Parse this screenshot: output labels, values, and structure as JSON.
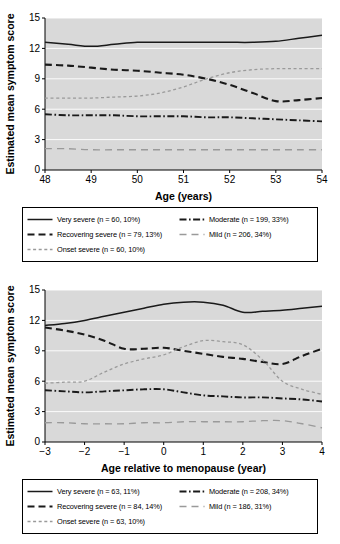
{
  "figure": {
    "panels": [
      {
        "id": "panel-age",
        "ylabel": "Estimated mean symptom score",
        "xlabel": "Age (years)",
        "legend": [
          {
            "label": "Very severe (n = 60, 10%)",
            "style": "solid",
            "color": "#1a1a1a"
          },
          {
            "label": "Recovering severe (n = 79, 13%)",
            "style": "dashed",
            "color": "#1a1a1a"
          },
          {
            "label": "Onset severe (n = 60, 10%)",
            "style": "dotted",
            "color": "#9a9a9a"
          },
          {
            "label": "Moderate (n = 199, 33%)",
            "style": "dashdot",
            "color": "#1a1a1a"
          },
          {
            "label": "Mild (n = 206, 34%)",
            "style": "longdash",
            "color": "#9a9a9a"
          }
        ]
      },
      {
        "id": "panel-menopause",
        "ylabel": "Estimated mean symptom score",
        "xlabel": "Age relative to menopause (year)",
        "legend": [
          {
            "label": "Very severe (n = 63, 11%)",
            "style": "solid",
            "color": "#1a1a1a"
          },
          {
            "label": "Recovering severe (n = 84, 14%)",
            "style": "dashed",
            "color": "#1a1a1a"
          },
          {
            "label": "Onset severe (n = 63, 10%)",
            "style": "dotted",
            "color": "#9a9a9a"
          },
          {
            "label": "Moderate (n = 208, 34%)",
            "style": "dashdot",
            "color": "#1a1a1a"
          },
          {
            "label": "Mild (n = 186, 31%)",
            "style": "longdash",
            "color": "#9a9a9a"
          }
        ]
      }
    ]
  },
  "chart_data": [
    {
      "type": "line",
      "title": "",
      "xlabel": "Age (years)",
      "ylabel": "Estimated mean symptom score",
      "xlim": [
        48,
        54
      ],
      "ylim": [
        0,
        15
      ],
      "xticks": [
        48,
        49,
        50,
        51,
        52,
        53,
        54
      ],
      "yticks": [
        0,
        3,
        6,
        9,
        12,
        15
      ],
      "grid": true,
      "grid_axis": "y",
      "plot_background": "#d9d9d9",
      "legend_position": "below",
      "x": [
        48,
        48.5,
        49,
        49.5,
        50,
        50.5,
        51,
        51.5,
        52,
        52.5,
        53,
        53.5,
        54
      ],
      "series": [
        {
          "name": "Very severe (n = 60, 10%)",
          "n": 60,
          "percent": 10,
          "style": "solid",
          "color": "#1a1a1a",
          "values": [
            12.6,
            12.4,
            12.2,
            12.4,
            12.6,
            12.6,
            12.6,
            12.6,
            12.6,
            12.6,
            12.7,
            13.0,
            13.3
          ]
        },
        {
          "name": "Recovering severe (n = 79, 13%)",
          "n": 79,
          "percent": 13,
          "style": "dashed",
          "color": "#1a1a1a",
          "values": [
            10.4,
            10.3,
            10.1,
            9.9,
            9.8,
            9.6,
            9.4,
            9.0,
            8.4,
            7.6,
            6.8,
            6.9,
            7.1
          ]
        },
        {
          "name": "Onset severe (n = 60, 10%)",
          "n": 60,
          "percent": 10,
          "style": "dotted",
          "color": "#9a9a9a",
          "values": [
            7.1,
            7.1,
            7.1,
            7.2,
            7.3,
            7.6,
            8.2,
            9.0,
            9.6,
            9.9,
            10.0,
            10.0,
            10.0
          ]
        },
        {
          "name": "Moderate (n = 199, 33%)",
          "n": 199,
          "percent": 33,
          "style": "dashdot",
          "color": "#1a1a1a",
          "values": [
            5.5,
            5.4,
            5.4,
            5.4,
            5.3,
            5.3,
            5.3,
            5.2,
            5.2,
            5.1,
            5.0,
            4.9,
            4.8
          ]
        },
        {
          "name": "Mild (n = 206, 34%)",
          "n": 206,
          "percent": 34,
          "style": "longdash",
          "color": "#9a9a9a",
          "values": [
            2.1,
            2.1,
            2.0,
            2.0,
            2.0,
            2.0,
            2.0,
            2.0,
            2.0,
            2.0,
            2.0,
            2.0,
            2.0
          ]
        }
      ]
    },
    {
      "type": "line",
      "title": "",
      "xlabel": "Age relative to menopause (year)",
      "ylabel": "Estimated mean symptom score",
      "xlim": [
        -3,
        4
      ],
      "ylim": [
        0,
        15
      ],
      "xticks": [
        -3,
        -2,
        -1,
        0,
        1,
        2,
        3,
        4
      ],
      "yticks": [
        0,
        3,
        6,
        9,
        12,
        15
      ],
      "grid": true,
      "grid_axis": "y",
      "plot_background": "#d9d9d9",
      "legend_position": "below",
      "x": [
        -3,
        -2.5,
        -2,
        -1.5,
        -1,
        -0.5,
        0,
        0.5,
        1,
        1.5,
        2,
        2.5,
        3,
        3.5,
        4
      ],
      "series": [
        {
          "name": "Very severe (n = 63, 11%)",
          "n": 63,
          "percent": 11,
          "style": "solid",
          "color": "#1a1a1a",
          "values": [
            11.5,
            11.7,
            12.0,
            12.4,
            12.8,
            13.2,
            13.6,
            13.8,
            13.8,
            13.5,
            12.8,
            12.9,
            13.0,
            13.2,
            13.4
          ]
        },
        {
          "name": "Recovering severe (n = 84, 14%)",
          "n": 84,
          "percent": 14,
          "style": "dashed",
          "color": "#1a1a1a",
          "values": [
            11.3,
            11.0,
            10.6,
            10.0,
            9.2,
            9.2,
            9.3,
            9.0,
            8.7,
            8.4,
            8.2,
            7.9,
            7.7,
            8.5,
            9.2
          ]
        },
        {
          "name": "Onset severe (n = 63, 10%)",
          "n": 63,
          "percent": 10,
          "style": "dotted",
          "color": "#9a9a9a",
          "values": [
            5.8,
            5.9,
            6.0,
            6.9,
            7.7,
            8.2,
            8.6,
            9.4,
            10.0,
            9.9,
            9.6,
            8.1,
            6.0,
            5.2,
            4.7
          ]
        },
        {
          "name": "Moderate (n = 208, 34%)",
          "n": 208,
          "percent": 34,
          "style": "dashdot",
          "color": "#1a1a1a",
          "values": [
            5.1,
            5.0,
            4.9,
            5.0,
            5.1,
            5.2,
            5.2,
            4.9,
            4.6,
            4.5,
            4.4,
            4.4,
            4.3,
            4.2,
            4.0
          ]
        },
        {
          "name": "Mild (n = 186, 31%)",
          "n": 186,
          "percent": 31,
          "style": "longdash",
          "color": "#9a9a9a",
          "values": [
            1.9,
            1.9,
            1.8,
            1.8,
            1.8,
            1.9,
            1.9,
            2.0,
            2.0,
            2.0,
            2.0,
            2.1,
            2.1,
            1.8,
            1.4
          ]
        }
      ]
    }
  ]
}
